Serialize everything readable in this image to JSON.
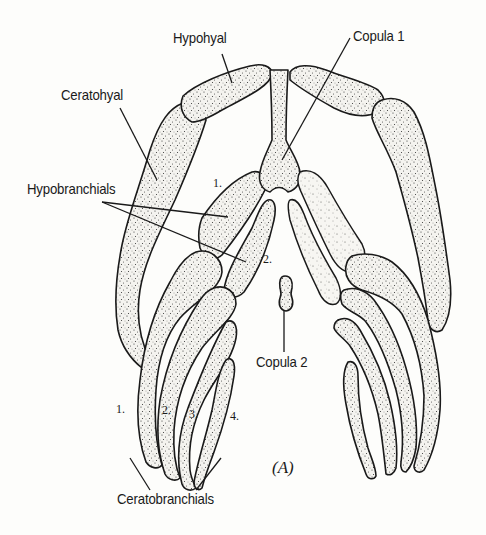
{
  "figure": {
    "panel_label": "(A)",
    "labels": {
      "hypohyal": "Hypohyal",
      "copula1": "Copula 1",
      "ceratohyal": "Ceratohyal",
      "hypobranchials": "Hypobranchials",
      "copula2": "Copula 2",
      "ceratobranchials": "Ceratobranchials"
    },
    "hypobranchial_numbers": [
      "1.",
      "2."
    ],
    "ceratobranchial_numbers": [
      "1.",
      "2.",
      "3.",
      "4."
    ],
    "colors": {
      "ink": "#1a1a1a",
      "paper": "#fdfdfb"
    }
  }
}
